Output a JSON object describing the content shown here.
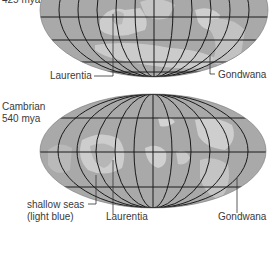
{
  "figure": {
    "upper_map": {
      "period_label_partial": "425 mya",
      "labels": {
        "laurentia": "Laurentia",
        "gondwana": "Gondwana"
      }
    },
    "lower_map": {
      "period_name": "Cambrian",
      "period_age": "540 mya",
      "labels": {
        "shallow_seas": "shallow seas",
        "shallow_seas_note": "(light blue)",
        "laurentia": "Laurentia",
        "gondwana": "Gondwana"
      }
    },
    "colors": {
      "ocean": "#a8a8a8",
      "shallow_sea": "#cfcfcf",
      "land": "#bcbcbc",
      "grid": "#1a1a1a",
      "text": "#3a3a3a"
    }
  }
}
